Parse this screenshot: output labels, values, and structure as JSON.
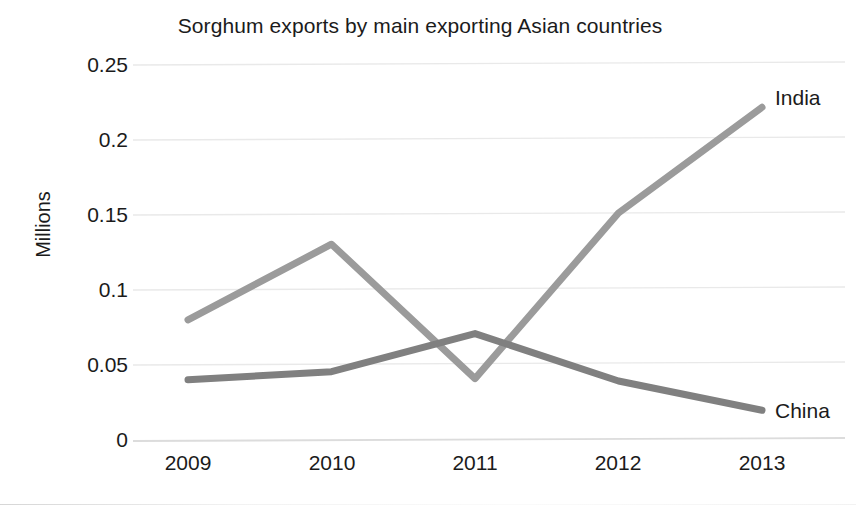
{
  "chart_data": {
    "type": "line",
    "title": "Sorghum exports by main exporting Asian countries",
    "xlabel": "",
    "ylabel": "Millions",
    "x": [
      "2009",
      "2010",
      "2011",
      "2012",
      "2013"
    ],
    "categories": [
      "2009",
      "2010",
      "2011",
      "2012",
      "2013"
    ],
    "series": [
      {
        "name": "India",
        "color": "#9b9b9b",
        "values": [
          0.08,
          0.13,
          0.04,
          0.15,
          0.22
        ],
        "label_text": "India"
      },
      {
        "name": "China",
        "color": "#808080",
        "values": [
          0.04,
          0.045,
          0.07,
          0.038,
          0.018
        ],
        "label_text": "China"
      }
    ],
    "ylim": [
      0,
      0.25
    ],
    "yticks": [
      "0",
      "0.05",
      "0.1",
      "0.15",
      "0.2",
      "0.25"
    ],
    "ytick_values": [
      0,
      0.05,
      0.1,
      0.15,
      0.2,
      0.25
    ],
    "grid": true,
    "grid_axis": "y",
    "grid_color": "#e8e8e8",
    "legend": "inline-end-labels",
    "legend_position": "right of last data point",
    "background": "#ffffff"
  }
}
